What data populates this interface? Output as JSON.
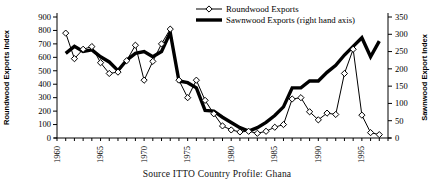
{
  "figure": {
    "caption": "Source  ITTO Country Profile: Ghana"
  },
  "chart_data": {
    "type": "line",
    "title": "",
    "x": [
      1961,
      1962,
      1963,
      1964,
      1965,
      1966,
      1967,
      1968,
      1969,
      1970,
      1971,
      1972,
      1973,
      1974,
      1975,
      1976,
      1977,
      1978,
      1979,
      1980,
      1981,
      1982,
      1983,
      1984,
      1985,
      1986,
      1987,
      1988,
      1989,
      1990,
      1991,
      1992,
      1993,
      1994,
      1995,
      1996,
      1997
    ],
    "series": [
      {
        "name": "Roundwood Exports",
        "axis": "left",
        "marker": "diamond-open",
        "line_width": 1,
        "values": [
          780,
          590,
          660,
          680,
          560,
          480,
          490,
          575,
          690,
          430,
          570,
          700,
          810,
          430,
          300,
          430,
          280,
          180,
          90,
          60,
          45,
          50,
          35,
          50,
          80,
          100,
          290,
          300,
          195,
          135,
          185,
          175,
          480,
          660,
          170,
          40,
          25
        ]
      },
      {
        "name": "Sawnwood Exports (right hand axis)",
        "axis": "right",
        "marker": "none",
        "line_width": 3.4,
        "values": [
          245,
          265,
          250,
          255,
          235,
          220,
          195,
          225,
          245,
          250,
          235,
          250,
          305,
          165,
          160,
          145,
          80,
          78,
          60,
          45,
          30,
          20,
          30,
          45,
          65,
          90,
          145,
          145,
          165,
          165,
          190,
          210,
          240,
          265,
          290,
          235,
          280
        ]
      }
    ],
    "left_axis": {
      "label": "Roundwood Exports Index",
      "min": 0,
      "max": 900,
      "step": 100
    },
    "right_axis": {
      "label": "Sawnwood Export Index",
      "min": 0,
      "max": 350,
      "step": 50
    },
    "x_axis": {
      "min": 1960,
      "max": 1998,
      "tick_every": 1,
      "labels": [
        "1960",
        "1965",
        "1970",
        "1975",
        "1980",
        "1985",
        "1990",
        "1995"
      ],
      "label_every": 5
    },
    "legend_position": "top-center",
    "grid": false,
    "colors": {
      "line": "#000000",
      "marker_fill": "#ffffff",
      "background": "#ffffff"
    }
  }
}
